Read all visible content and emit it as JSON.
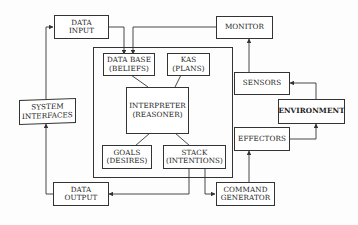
{
  "diagram": {
    "type": "architecture block diagram",
    "nodes": {
      "data_input": {
        "line1": "DATA",
        "line2": "INPUT"
      },
      "monitor": {
        "line1": "MONITOR"
      },
      "system_interfaces": {
        "line1": "SYSTEM",
        "line2": "INTERFACES"
      },
      "data_base": {
        "line1": "DATA BASE",
        "line2": "(BELIEFS)"
      },
      "kas": {
        "line1": "KAS",
        "line2": "(PLANS)"
      },
      "interpreter": {
        "line1": "INTERPRETER",
        "line2": "(REASONER)"
      },
      "goals": {
        "line1": "GOALS",
        "line2": "(DESIRES)"
      },
      "stack": {
        "line1": "STACK",
        "line2": "(INTENTIONS)"
      },
      "sensors": {
        "line1": "SENSORS"
      },
      "environment": {
        "line1": "ENVIRONMENT"
      },
      "effectors": {
        "line1": "EFFECTORS"
      },
      "data_output": {
        "line1": "DATA",
        "line2": "OUTPUT"
      },
      "command_generator": {
        "line1": "COMMAND",
        "line2": "GENERATOR"
      }
    },
    "edges": [
      {
        "from": "system_interfaces",
        "to": "data_input"
      },
      {
        "from": "data_input",
        "to": "data_base"
      },
      {
        "from": "monitor",
        "to": "data_base"
      },
      {
        "from": "sensors",
        "to": "monitor"
      },
      {
        "from": "environment",
        "to": "sensors"
      },
      {
        "from": "effectors",
        "to": "environment"
      },
      {
        "from": "command_generator",
        "to": "effectors"
      },
      {
        "from": "stack",
        "to": "command_generator"
      },
      {
        "from": "stack",
        "to": "data_output"
      },
      {
        "from": "data_output",
        "to": "system_interfaces"
      },
      {
        "from": "data_base",
        "to": "interpreter"
      },
      {
        "from": "kas",
        "to": "interpreter"
      },
      {
        "from": "interpreter",
        "to": "goals"
      },
      {
        "from": "interpreter",
        "to": "stack"
      }
    ]
  }
}
